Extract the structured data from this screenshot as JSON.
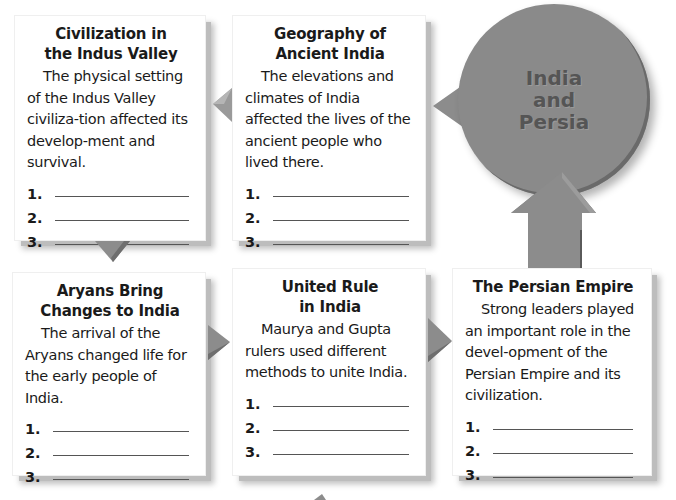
{
  "center": {
    "lines": [
      "India",
      "and",
      "Persia"
    ],
    "color": "#8a8a8a"
  },
  "cards": [
    {
      "title_lines": [
        "Civilization in",
        "the Indus Valley"
      ],
      "body": "The physical setting of the Indus Valley civiliza-tion affected its develop-ment and survival.",
      "items": [
        "1.",
        "2.",
        "3."
      ]
    },
    {
      "title_lines": [
        "Geography of",
        "Ancient India"
      ],
      "body": "The elevations and climates of India affected the lives of the ancient people who lived there.",
      "items": [
        "1.",
        "2.",
        "3."
      ]
    },
    {
      "title_lines": [
        "Aryans Bring",
        "Changes to India"
      ],
      "body": "The arrival of the Aryans changed life for the early people of India.",
      "items": [
        "1.",
        "2.",
        "3."
      ]
    },
    {
      "title_lines": [
        "United Rule",
        "in India"
      ],
      "body": "Maurya and Gupta rulers used different methods to unite India.",
      "items": [
        "1.",
        "2.",
        "3."
      ]
    },
    {
      "title_lines": [
        "The Persian Empire"
      ],
      "body": "Strong leaders played an important role in the devel-opment of the Persian Empire and its civilization.",
      "items": [
        "1.",
        "2.",
        "3."
      ]
    }
  ],
  "colors": {
    "arrow": "#8c8c8c",
    "arrow_dark": "#6e6e6e",
    "shadow": "#bdbdbd"
  }
}
